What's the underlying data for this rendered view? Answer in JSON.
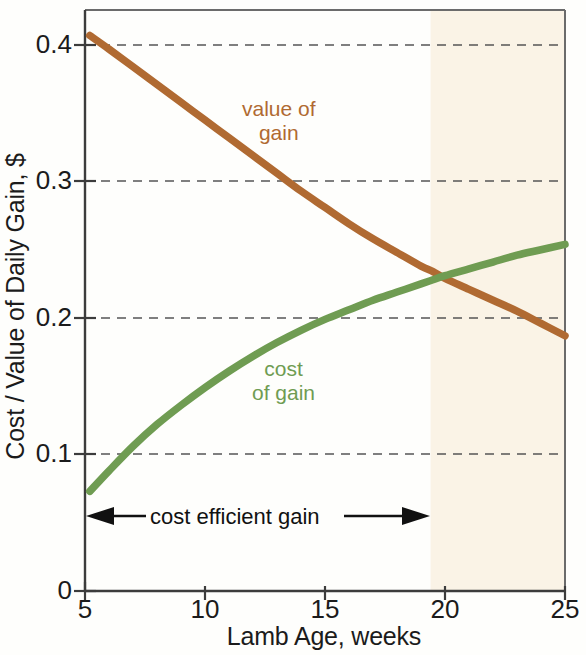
{
  "chart_data": {
    "type": "line",
    "title": "",
    "xlabel": "Lamb Age, weeks",
    "ylabel": "Cost / Value of Daily Gain, $",
    "xlim": [
      5,
      25
    ],
    "ylim": [
      0,
      0.44
    ],
    "xticks": [
      "5",
      "10",
      "15",
      "20",
      "25"
    ],
    "xtick_values": [
      5,
      10,
      15,
      20,
      25
    ],
    "yticks": [
      "0",
      "0.1",
      "0.2",
      "0.3",
      "0.4"
    ],
    "ytick_values": [
      0,
      0.1,
      0.2,
      0.3,
      0.4
    ],
    "grid": "horizontal-dashed",
    "legend": "inline-labels",
    "series": [
      {
        "name": "value of gain",
        "label": "value of\ngain",
        "label_line1": "value of",
        "label_line2": "gain",
        "color": "#b06a32",
        "x": [
          5.2,
          6,
          7,
          8,
          9,
          10,
          11,
          12,
          13,
          14,
          15,
          16,
          17,
          18,
          19,
          19.5,
          20,
          21,
          22,
          23,
          24,
          25
        ],
        "values": [
          0.407,
          0.397,
          0.384,
          0.371,
          0.358,
          0.345,
          0.332,
          0.319,
          0.306,
          0.293,
          0.281,
          0.269,
          0.258,
          0.248,
          0.238,
          0.234,
          0.229,
          0.221,
          0.213,
          0.205,
          0.196,
          0.187
        ]
      },
      {
        "name": "cost of gain",
        "label": "cost\nof gain",
        "label_line1": "cost",
        "label_line2": "of gain",
        "color": "#6f9c52",
        "x": [
          5.2,
          6,
          7,
          8,
          9,
          10,
          11,
          12,
          13,
          14,
          15,
          16,
          17,
          18,
          19,
          19.5,
          20,
          21,
          22,
          23,
          24,
          25
        ],
        "values": [
          0.073,
          0.088,
          0.106,
          0.122,
          0.136,
          0.149,
          0.161,
          0.172,
          0.182,
          0.191,
          0.199,
          0.206,
          0.213,
          0.219,
          0.225,
          0.228,
          0.231,
          0.236,
          0.241,
          0.246,
          0.25,
          0.254
        ]
      }
    ],
    "crossing_point": {
      "x": 19.5,
      "y": 0.234
    },
    "shaded_region": {
      "name": "inefficient-gain-shading",
      "x_start": 19.4,
      "x_end": 25,
      "color": "#faf3e6"
    },
    "annotations": [
      {
        "name": "cost-efficient-gain",
        "text": "cost efficient gain",
        "x_start": 5,
        "x_end": 19.4,
        "y": 0.05,
        "style": "double-headed-arrow"
      }
    ]
  },
  "axis": {
    "ylabel": "Cost / Value of Daily Gain, $",
    "xlabel": "Lamb Age, weeks"
  }
}
